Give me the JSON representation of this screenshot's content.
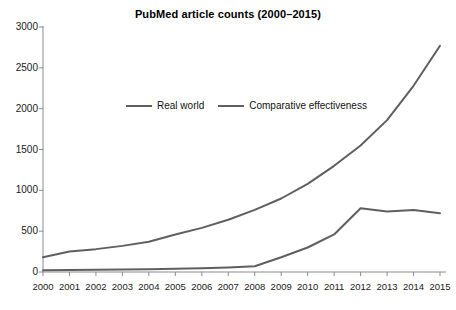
{
  "chart_data": {
    "type": "line",
    "title": "PubMed article counts (2000–2015)",
    "xlabel": "",
    "ylabel": "",
    "x": [
      2000,
      2001,
      2002,
      2003,
      2004,
      2005,
      2006,
      2007,
      2008,
      2009,
      2010,
      2011,
      2012,
      2013,
      2014,
      2015
    ],
    "categories": [
      "2000",
      "2001",
      "2002",
      "2003",
      "2004",
      "2005",
      "2006",
      "2007",
      "2008",
      "2009",
      "2010",
      "2011",
      "2012",
      "2013",
      "2014",
      "2015"
    ],
    "series": [
      {
        "name": "Real world",
        "color": "#5f5f5f",
        "values": [
          180,
          250,
          280,
          320,
          370,
          460,
          540,
          640,
          760,
          900,
          1080,
          1300,
          1550,
          1860,
          2280,
          2770
        ]
      },
      {
        "name": "Comparative effectiveness",
        "color": "#5f5f5f",
        "values": [
          20,
          25,
          28,
          30,
          35,
          40,
          45,
          55,
          70,
          180,
          300,
          460,
          780,
          740,
          760,
          720
        ]
      }
    ],
    "ylim": [
      0,
      3000
    ],
    "yticks": [
      0,
      500,
      1000,
      1500,
      2000,
      2500,
      3000
    ],
    "ytick_labels": [
      "0",
      "500",
      "1000",
      "1500",
      "2000",
      "2500",
      "3000"
    ],
    "xlim": [
      2000,
      2015
    ],
    "grid": false,
    "legend_position": "inside-upper-center",
    "legend_entries": [
      "Real world",
      "Comparative effectiveness"
    ],
    "axis_color": "#8a8a8a",
    "background": "#ffffff"
  }
}
